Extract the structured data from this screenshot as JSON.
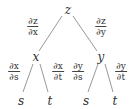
{
  "diagram": {
    "type": "tree",
    "root": "z",
    "level1": [
      {
        "label": "x",
        "edge_label": {
          "num": "∂z",
          "den": "∂x"
        }
      },
      {
        "label": "y",
        "edge_label": {
          "num": "∂z",
          "den": "∂y"
        }
      }
    ],
    "level2": [
      {
        "parent": "x",
        "label": "s",
        "edge_label": {
          "num": "∂x",
          "den": "∂s"
        }
      },
      {
        "parent": "x",
        "label": "t",
        "edge_label": {
          "num": "∂x",
          "den": "∂t"
        }
      },
      {
        "parent": "y",
        "label": "s",
        "edge_label": {
          "num": "∂y",
          "den": "∂s"
        }
      },
      {
        "parent": "y",
        "label": "t",
        "edge_label": {
          "num": "∂y",
          "den": "∂t"
        }
      }
    ],
    "line_color": "#888888"
  }
}
